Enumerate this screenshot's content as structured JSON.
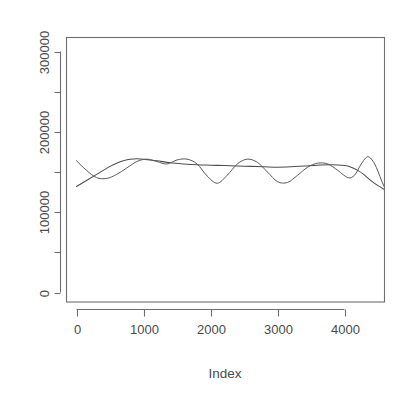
{
  "chart_data": {
    "type": "line",
    "title": "",
    "subtitle": "",
    "xlabel": "Index",
    "ylabel": "",
    "xlim": [
      -150,
      4620
    ],
    "ylim": [
      -20000,
      330000
    ],
    "grid": false,
    "legend": "none",
    "background": "#ffffff",
    "line_color": "#4d4d4d",
    "axis_color": "#6e6e6e",
    "text_color": "#4a4a4a",
    "x_ticks": [
      {
        "value": 0,
        "label": "0"
      },
      {
        "value": 1000,
        "label": "1000"
      },
      {
        "value": 2000,
        "label": "2000"
      },
      {
        "value": 3000,
        "label": "3000"
      },
      {
        "value": 4000,
        "label": "4000"
      }
    ],
    "x_minor_ticks": [
      500,
      1500,
      2500,
      3500,
      4500
    ],
    "y_ticks": [
      {
        "value": 0,
        "label": "0"
      },
      {
        "value": 100000,
        "label": "100000"
      },
      {
        "value": 200000,
        "label": "200000"
      },
      {
        "value": 300000,
        "label": "300000"
      }
    ],
    "y_minor_ticks": [
      50000,
      150000,
      250000
    ],
    "series": [
      {
        "name": "trend",
        "style": "smooth",
        "x": [
          0,
          100,
          200,
          300,
          400,
          500,
          600,
          700,
          800,
          900,
          1000,
          1200,
          1400,
          1600,
          1800,
          2000,
          2200,
          2400,
          2600,
          2800,
          3000,
          3200,
          3400,
          3600,
          3800,
          4000,
          4100,
          4200,
          4300,
          4400,
          4500,
          4600
        ],
        "y": [
          132000,
          137000,
          142000,
          147000,
          152000,
          157000,
          161000,
          164000,
          166000,
          166500,
          166000,
          164000,
          161500,
          160000,
          159000,
          158500,
          158000,
          157500,
          157000,
          156500,
          156000,
          156500,
          157500,
          158500,
          159000,
          158000,
          156000,
          152000,
          146000,
          139000,
          133000,
          128000
        ]
      },
      {
        "name": "oscillating",
        "style": "oscillating",
        "x": [
          0,
          150,
          300,
          450,
          600,
          750,
          900,
          1050,
          1200,
          1350,
          1500,
          1650,
          1800,
          1950,
          2100,
          2250,
          2400,
          2550,
          2700,
          2850,
          3000,
          3150,
          3300,
          3450,
          3600,
          3750,
          3900,
          4050,
          4150,
          4250,
          4350,
          4450,
          4550,
          4600
        ],
        "y": [
          164000,
          152000,
          143000,
          142000,
          147000,
          155000,
          163000,
          166000,
          163000,
          160000,
          165000,
          166000,
          160000,
          145000,
          136000,
          146000,
          160000,
          166000,
          162000,
          150000,
          138000,
          137000,
          146000,
          156000,
          161000,
          160000,
          152000,
          143000,
          146000,
          160000,
          169000,
          160000,
          140000,
          130000
        ]
      }
    ]
  },
  "axis": {
    "x_title": "Index"
  }
}
